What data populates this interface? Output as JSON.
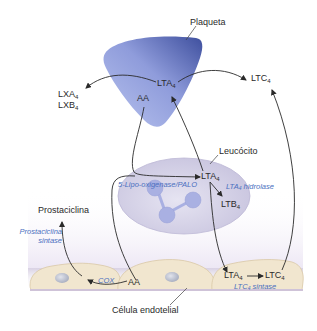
{
  "diagram": {
    "cells": {
      "platelet": "Plaqueta",
      "leukocyte": "Leucócito",
      "endothelial": "Célula endotelial"
    },
    "platelet_labels": {
      "aa": "AA",
      "lta4_base": "LTA",
      "lta4_sub": "4"
    },
    "products": {
      "lxa4_base": "LXA",
      "lxa4_sub": "4",
      "lxb4_base": "LXB",
      "lxb4_sub": "4",
      "ltc4_top_base": "LTC",
      "ltc4_top_sub": "4",
      "prostacyclin": "Prostaciclina"
    },
    "leukocyte_labels": {
      "lta4_base": "LTA",
      "lta4_sub": "4",
      "ltb4_base": "LTB",
      "ltb4_sub": "4"
    },
    "endothelial_labels": {
      "aa": "AA",
      "lta4_base": "LTA",
      "lta4_sub": "4",
      "ltc4_base": "LTC",
      "ltc4_sub": "4"
    },
    "enzymes": {
      "lipoxygenase": "5-Lipo-oxigenase/PALO",
      "lta4_hydrolase_base": "LTA",
      "lta4_hydrolase_sub": "4",
      "lta4_hydrolase_rest": " hidrolase",
      "prostacyclin_synthase_line1": "Prostaciclina",
      "prostacyclin_synthase_line2": "sintase",
      "cox": "COX",
      "ltc4_synthase_base": "LTC",
      "ltc4_synthase_sub": "4",
      "ltc4_synthase_rest": " sintase"
    },
    "colors": {
      "platelet_dark": "#4a5aa8",
      "platelet_light": "#a9b4e6",
      "leukocyte_fill": "#d9d6ea",
      "leukocyte_granule": "#a7aee0",
      "endothelial_fill": "#f1e6cf",
      "endothelial_nucleus": "#b8bccb",
      "enzyme_text": "#4a6fc0",
      "arrow": "#2a2a2a"
    }
  }
}
